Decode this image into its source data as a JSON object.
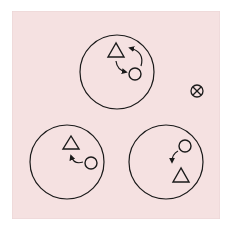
{
  "diagram": {
    "background_color": "#f5e1e1",
    "panel_border_color": "#e9d3d4",
    "stroke_color": "#1a1a1a",
    "observer_symbol": {
      "name": "into-page-symbol",
      "cx": 197,
      "cy": 91,
      "r": 6
    },
    "circles": [
      {
        "name": "circle-top",
        "cx": 117,
        "cy": 72,
        "r": 37,
        "triangle": {
          "cx": 116,
          "cy": 52,
          "size": 16
        },
        "small_circle": {
          "cx": 135,
          "cy": 74,
          "r": 6
        },
        "arrows": "two-way curved arrows between triangle and circle"
      },
      {
        "name": "circle-bottom-left",
        "cx": 67,
        "cy": 162,
        "r": 37,
        "triangle": {
          "cx": 71,
          "cy": 143,
          "size": 16
        },
        "small_circle": {
          "cx": 91,
          "cy": 162,
          "r": 6
        },
        "arrows": "curved arrow from circle toward triangle"
      },
      {
        "name": "circle-bottom-right",
        "cx": 166,
        "cy": 162,
        "r": 37,
        "triangle": {
          "cx": 181,
          "cy": 177,
          "size": 16
        },
        "small_circle": {
          "cx": 185,
          "cy": 146,
          "r": 6
        },
        "arrows": "curved arrow from circle down toward triangle"
      }
    ]
  }
}
